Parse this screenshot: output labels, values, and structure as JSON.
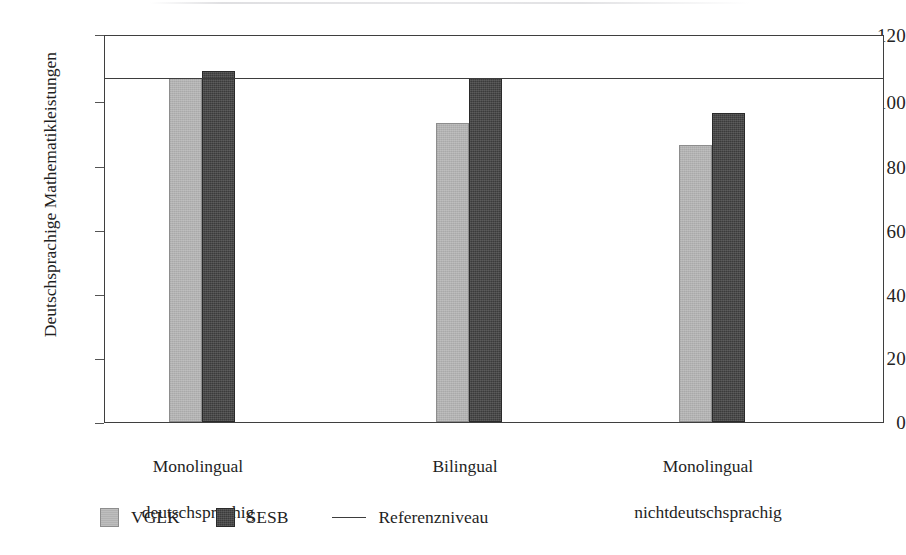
{
  "chart_data": {
    "type": "bar",
    "title": "",
    "xlabel": "",
    "ylabel": "Deutschsprachige Mathematikleistungen",
    "ylim": [
      0,
      120
    ],
    "yticks": [
      0,
      20,
      40,
      60,
      80,
      100,
      120
    ],
    "ytick_labels": [
      "0",
      "20",
      "40",
      "60",
      "80",
      "100",
      "120"
    ],
    "grid": false,
    "legend_position": "bottom-left",
    "categories": [
      "Monolingual\ndeutschsprachig",
      "Bilingual",
      "Monolingual\nnichtdeutschsprachig"
    ],
    "category_lines": [
      [
        "Monolingual",
        "deutschsprachig"
      ],
      [
        "Bilingual",
        ""
      ],
      [
        "Monolingual",
        "nichtdeutschsprachig"
      ]
    ],
    "series": [
      {
        "name": "VGLK",
        "color": "#b2b2b2",
        "values": [
          107,
          93,
          86
        ]
      },
      {
        "name": "SESB",
        "color": "#3b3b3b",
        "values": [
          109,
          107,
          96
        ]
      }
    ],
    "reference_line": {
      "label": "Referenzniveau",
      "value": 107,
      "color": "#3d3d3d"
    }
  },
  "legend": {
    "items": [
      {
        "label": "VGLK",
        "marker": "light-square-swatch"
      },
      {
        "label": "SESB",
        "marker": "dark-square-swatch"
      },
      {
        "label": "Referenzniveau",
        "marker": "horizontal-line"
      }
    ]
  }
}
